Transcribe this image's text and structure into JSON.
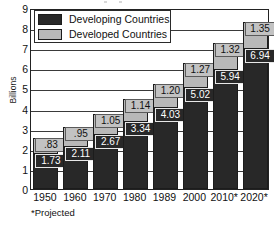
{
  "chart_data": {
    "type": "bar",
    "subtype": "stacked-bar",
    "title": "",
    "xlabel": "",
    "ylabel": "Billions",
    "ylim": [
      0,
      9
    ],
    "ytick_step": 1,
    "grid": true,
    "grid_axis": "y",
    "legend_position": "top-left inside plot",
    "categories": [
      "1950",
      "1960",
      "1970",
      "1980",
      "1989",
      "2000",
      "2010*",
      "2020*"
    ],
    "ytick_labels": [
      "9",
      "8",
      "7",
      "6",
      "5",
      "4",
      "3",
      "2",
      "1",
      "0"
    ],
    "series": [
      {
        "name": "Developing Countries",
        "color": "#282828",
        "values": [
          1.73,
          2.11,
          2.67,
          3.34,
          4.03,
          5.02,
          5.94,
          6.94
        ],
        "labels": [
          "1.73",
          "2.11",
          "2.67",
          "3.34",
          "4.03",
          "5.02",
          "5.94",
          "6.94"
        ]
      },
      {
        "name": "Developed Countries",
        "color": "#b8b8b8",
        "values": [
          0.83,
          0.95,
          1.05,
          1.14,
          1.2,
          1.27,
          1.32,
          1.35
        ],
        "labels": [
          ".83",
          ".95",
          "1.05",
          "1.14",
          "1.20",
          "1.27",
          "1.32",
          "1.35"
        ]
      }
    ],
    "totals": [
      2.56,
      3.06,
      3.72,
      4.48,
      5.23,
      6.29,
      7.26,
      8.29
    ],
    "annotations": [
      "*Projected"
    ]
  },
  "axes": {
    "y_title": "Billions",
    "y_ticks": [
      "9",
      "8",
      "7",
      "6",
      "5",
      "4",
      "3",
      "2",
      "1",
      "0"
    ],
    "x_ticks": [
      "1950",
      "1960",
      "1970",
      "1980",
      "1989",
      "2000",
      "2010*",
      "2020*"
    ]
  },
  "legend": {
    "items": [
      {
        "label": "Developing Countries",
        "color": "#282828"
      },
      {
        "label": "Developed Countries",
        "color": "#b8b8b8"
      }
    ]
  },
  "footnote": "*Projected",
  "colors": {
    "developing": "#282828",
    "developed": "#b8b8b8",
    "frame": "#222222",
    "background": "#ffffff",
    "text": "#111111"
  }
}
